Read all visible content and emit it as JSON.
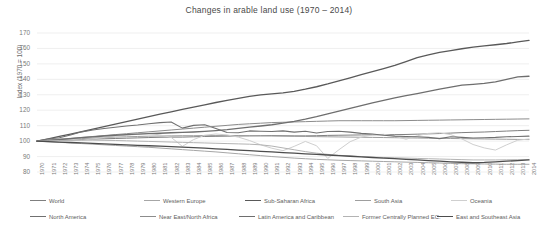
{
  "chart_data": {
    "type": "line",
    "title": "Changes in arable land use (1970 – 2014)",
    "xlabel": "",
    "ylabel": "Index (1970 = 100)",
    "ylim": [
      80,
      170
    ],
    "yticks": [
      80,
      90,
      100,
      110,
      120,
      130,
      140,
      150,
      160,
      170
    ],
    "grid": true,
    "legend_position": "bottom",
    "x": [
      1970,
      1971,
      1972,
      1973,
      1974,
      1975,
      1976,
      1977,
      1978,
      1979,
      1980,
      1981,
      1982,
      1983,
      1984,
      1985,
      1986,
      1987,
      1988,
      1989,
      1990,
      1991,
      1992,
      1993,
      1994,
      1995,
      1996,
      1997,
      1998,
      1999,
      2000,
      2001,
      2002,
      2003,
      2004,
      2005,
      2006,
      2007,
      2008,
      2009,
      2010,
      2011,
      2012,
      2013,
      2014
    ],
    "xticks": [
      "1970",
      "1971",
      "1972",
      "1973",
      "1974",
      "1975",
      "1976",
      "1977",
      "1978",
      "1979",
      "1980",
      "1981",
      "1982",
      "1983",
      "1984",
      "1985",
      "1986",
      "1987",
      "1988",
      "1989",
      "1990",
      "1991",
      "1992",
      "1993",
      "1994",
      "1995",
      "1996",
      "1997",
      "1998",
      "1999",
      "2000",
      "2001",
      "2002",
      "2003",
      "2004",
      "2005",
      "2006",
      "2007",
      "2008",
      "2009",
      "2010",
      "2011",
      "2012",
      "2013",
      "2014"
    ],
    "series": [
      {
        "name": "World",
        "color": "#7f7f7f",
        "width": 1.0,
        "values": [
          100,
          100.2,
          100.4,
          100.7,
          101,
          101.3,
          101.5,
          101.7,
          101.9,
          102.1,
          102.3,
          102.5,
          102.6,
          102.6,
          102.8,
          103,
          103.1,
          103.2,
          103.3,
          103.4,
          103.5,
          103.6,
          103.5,
          103.4,
          103.4,
          103.5,
          103.7,
          103.8,
          103.9,
          104,
          104.1,
          104.1,
          104.2,
          104.3,
          104.5,
          104.7,
          104.9,
          105.2,
          105.5,
          105.7,
          105.9,
          106.2,
          106.5,
          106.8,
          107
        ]
      },
      {
        "name": "Western Europe",
        "color": "#a6a6a6",
        "width": 1.0,
        "values": [
          100,
          99.6,
          99.2,
          98.8,
          98.4,
          98,
          97.6,
          97.2,
          96.8,
          96.4,
          96,
          95.5,
          95,
          94.5,
          94,
          93.5,
          93,
          92.4,
          91.8,
          91.2,
          90.6,
          90,
          89.5,
          89,
          88.6,
          88.2,
          87.9,
          87.6,
          87.4,
          87.2,
          87,
          86.8,
          86.6,
          86.4,
          86.2,
          86,
          85.8,
          85.6,
          85.4,
          85.3,
          85.2,
          85.1,
          85,
          85,
          85
        ]
      },
      {
        "name": "Sub-Saharan Africa",
        "color": "#595959",
        "width": 1.3,
        "values": [
          100,
          101.5,
          103,
          104.6,
          106.2,
          107.8,
          109.4,
          111,
          112.6,
          114.2,
          115.8,
          117.4,
          119,
          120.5,
          122,
          123.5,
          125,
          126.4,
          127.7,
          128.9,
          130,
          130.6,
          131.2,
          132.2,
          133.6,
          135.2,
          137,
          139,
          141,
          143,
          145,
          147,
          149,
          151.5,
          154,
          155.8,
          157.4,
          158.6,
          159.8,
          160.8,
          161.6,
          162.4,
          163.2,
          164.2,
          165.2
        ]
      },
      {
        "name": "South Asia",
        "color": "#9e9e9e",
        "width": 1.0,
        "values": [
          100,
          100.4,
          100.8,
          101.2,
          101.6,
          102,
          102.3,
          102.6,
          102.8,
          103,
          103.2,
          103.3,
          103.4,
          103.5,
          103.5,
          103.6,
          103.6,
          103.6,
          103.6,
          103.5,
          103.4,
          103.3,
          103.2,
          103.1,
          103,
          102.9,
          102.8,
          102.7,
          102.6,
          102.5,
          102.4,
          102.3,
          102.2,
          102.1,
          102,
          101.9,
          101.8,
          101.7,
          101.6,
          101.5,
          101.4,
          101.3,
          101.2,
          101.1,
          101
        ]
      },
      {
        "name": "Oceania",
        "color": "#cfcfcf",
        "width": 1.0,
        "values": [
          100,
          100.8,
          101.6,
          101.2,
          100.6,
          101.4,
          102.4,
          103.2,
          103.8,
          104.4,
          105,
          104,
          102.4,
          96.6,
          101,
          103.8,
          104.6,
          104,
          102.6,
          100.4,
          97.6,
          95.4,
          93.8,
          96.6,
          99.8,
          97,
          88.8,
          94.4,
          99.6,
          102.6,
          104,
          104.4,
          103.2,
          101.2,
          103.4,
          105,
          105.4,
          104.2,
          101.4,
          97.8,
          95.6,
          94.2,
          97.6,
          100.6,
          101.4
        ]
      },
      {
        "name": "North America",
        "color": "#707070",
        "width": 1.1,
        "values": [
          100,
          101.4,
          102.2,
          104,
          106,
          107.2,
          108.2,
          109,
          109.8,
          110.4,
          111.2,
          112,
          112.4,
          108.4,
          110.2,
          110.6,
          108.2,
          105.6,
          105.4,
          106.6,
          106.4,
          106.2,
          106.6,
          105.8,
          106.4,
          105.2,
          106.2,
          106.4,
          105.8,
          105,
          104.6,
          103.8,
          103.2,
          103,
          102.8,
          102.4,
          101.6,
          102.8,
          102.4,
          102,
          102.2,
          102.4,
          102.8,
          103,
          103.2
        ]
      },
      {
        "name": "Near East/North Africa",
        "color": "#8c8c8c",
        "width": 1.0,
        "values": [
          100,
          100.6,
          101.2,
          101.8,
          102.4,
          103,
          103.6,
          104.2,
          104.8,
          105.4,
          106,
          106.6,
          107.2,
          107.8,
          108.4,
          109,
          109.6,
          110.2,
          110.8,
          111.2,
          111.6,
          112,
          112.2,
          112.4,
          112.6,
          112.8,
          113,
          113.2,
          113.2,
          113.2,
          113.2,
          113.2,
          113.2,
          113.3,
          113.4,
          113.5,
          113.6,
          113.7,
          113.8,
          113.9,
          114,
          114.1,
          114.2,
          114.3,
          114.4
        ]
      },
      {
        "name": "Latin America and Caribbean",
        "color": "#6e6e6e",
        "width": 1.3,
        "values": [
          100,
          100.4,
          101,
          101.6,
          102.2,
          102.8,
          103.3,
          103.8,
          104.2,
          104.5,
          104.8,
          105.1,
          105.4,
          105.6,
          105.9,
          106.3,
          106.8,
          107.4,
          108.2,
          109,
          109.8,
          110.6,
          111.6,
          112.8,
          114.2,
          115.8,
          117.6,
          119.4,
          121.2,
          123,
          124.8,
          126.4,
          128,
          129.4,
          130.8,
          132.2,
          133.6,
          135,
          136.2,
          136.8,
          137.4,
          138.4,
          140,
          141.6,
          142
        ]
      },
      {
        "name": "Former Centrally Planned EC.",
        "color": "#b3b3b3",
        "width": 1.0,
        "values": [
          100,
          100.2,
          100.4,
          100.5,
          100.6,
          100.6,
          100.5,
          100.4,
          100.2,
          100,
          99.8,
          99.6,
          99.4,
          99.2,
          99,
          98.8,
          98.6,
          98.4,
          98.2,
          98,
          97.6,
          96.8,
          95.6,
          94.4,
          93.2,
          92.2,
          91.4,
          90.8,
          90.4,
          90,
          89.6,
          89.4,
          89.2,
          89,
          88.8,
          88.6,
          88.4,
          88.2,
          88,
          87.8,
          87.8,
          87.8,
          87.9,
          88,
          88.1
        ]
      },
      {
        "name": "East and Southeast Asia",
        "color": "#4d4d4d",
        "width": 1.3,
        "values": [
          100,
          99.7,
          99.4,
          99.1,
          98.8,
          98.5,
          98.2,
          97.9,
          97.6,
          97.3,
          97,
          96.7,
          96.4,
          96.1,
          95.8,
          95.4,
          95,
          94.6,
          94.2,
          93.8,
          93.4,
          93,
          92.6,
          92.2,
          91.8,
          91.4,
          91,
          90.6,
          90.2,
          89.8,
          89.4,
          89,
          88.6,
          88.2,
          87.8,
          87.4,
          87,
          86.6,
          86.3,
          86,
          86.2,
          86.6,
          87,
          87.4,
          87.8
        ]
      }
    ]
  },
  "legend": {
    "row1": [
      {
        "label": "World"
      },
      {
        "label": "Western Europe"
      },
      {
        "label": "Sub-Saharan Africa"
      },
      {
        "label": "South Asia"
      },
      {
        "label": "Oceania"
      }
    ],
    "row2": [
      {
        "label": "North America"
      },
      {
        "label": "Near East/North Africa"
      },
      {
        "label": "Latin America and Caribbean"
      },
      {
        "label": "Former Centrally Planned EC."
      },
      {
        "label": "East and Southeast Asia"
      }
    ]
  }
}
